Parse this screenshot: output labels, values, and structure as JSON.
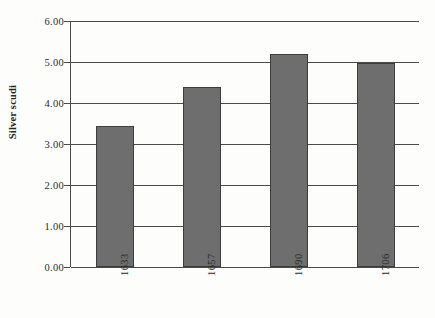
{
  "chart_data": {
    "type": "bar",
    "title": "",
    "xlabel": "",
    "ylabel": "Silver scudi",
    "categories": [
      "1633",
      "1657",
      "1690",
      "1706"
    ],
    "values": [
      3.43,
      4.39,
      5.2,
      4.98
    ],
    "ylim": [
      0.0,
      6.0
    ],
    "ytick_labels": [
      "0.00",
      "1.00",
      "2.00",
      "3.00",
      "4.00",
      "5.00",
      "6.00"
    ],
    "ytick_values": [
      0,
      1,
      2,
      3,
      4,
      5,
      6
    ],
    "grid": "horizontal",
    "legend": "none",
    "bar_color": "#6e6e6e",
    "bar_border_color": "#3d3d3d",
    "axis_color": "#4a4a4a",
    "background_color": "#fdfdfc"
  }
}
